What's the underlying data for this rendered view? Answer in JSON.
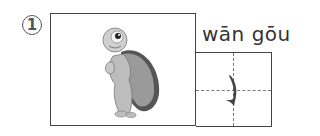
{
  "item": {
    "number": "1",
    "number_display": "①",
    "picture": {
      "subject": "turtle",
      "icon": "turtle-illustration-icon"
    },
    "pinyin": "wān gōu",
    "character_stroke": {
      "name": "wān gōu",
      "glyph": "㇁",
      "icon": "bent-hook-stroke-icon"
    },
    "grid": {
      "type": "tian-zi-ge",
      "guide_lines": "dashed"
    }
  },
  "colors": {
    "border": "#444444",
    "text": "#333333",
    "stroke": "#444444",
    "shell_dark": "#555555",
    "shell_light": "#999999",
    "skin": "#bdbdbd"
  }
}
